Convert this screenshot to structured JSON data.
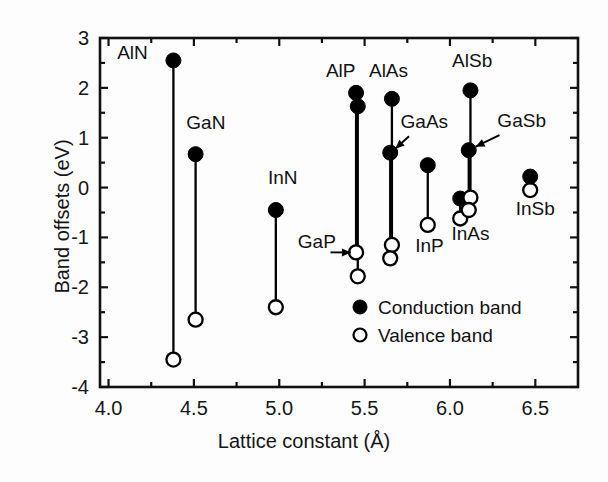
{
  "chart_data": {
    "type": "scatter",
    "title": "",
    "xlabel": "Lattice constant (Å)",
    "ylabel": "Band offsets (eV)",
    "xlim": [
      3.95,
      6.75
    ],
    "ylim": [
      -4,
      3
    ],
    "xticks": [
      4.0,
      4.5,
      5.0,
      5.5,
      6.0,
      6.5
    ],
    "xticklabels": [
      "4.0",
      "4.5",
      "5.0",
      "5.5",
      "6.0",
      "6.5"
    ],
    "xminorticks": [
      4.25,
      4.75,
      5.25,
      5.75,
      6.25,
      6.75
    ],
    "yticks": [
      -4,
      -3,
      -2,
      -1,
      0,
      1,
      2,
      3
    ],
    "yticklabels": [
      "-4",
      "-3",
      "-2",
      "-1",
      "0",
      "1",
      "2",
      "3"
    ],
    "yminorticks": [
      -3.5,
      -2.5,
      -1.5,
      -0.5,
      0.5,
      1.5,
      2.5
    ],
    "grid": false,
    "legend_position": "lower-right",
    "legend": [
      {
        "marker": "filled-circle",
        "label": "Conduction band"
      },
      {
        "marker": "open-circle",
        "label": "Valence band"
      }
    ],
    "series": [
      {
        "name": "Conduction band",
        "marker": "filled-circle",
        "color": "#000000"
      },
      {
        "name": "Valence band",
        "marker": "open-circle",
        "color": "#000000"
      }
    ],
    "points": [
      {
        "material": "AlN",
        "lattice_constant": 4.38,
        "conduction_band": 2.55,
        "valence_band": -3.45,
        "label_x": 4.23,
        "label_y": 2.58,
        "label_anchor": "end"
      },
      {
        "material": "GaN",
        "lattice_constant": 4.51,
        "conduction_band": 0.67,
        "valence_band": -2.65,
        "label_x": 4.57,
        "label_y": 1.18,
        "label_anchor": "middle"
      },
      {
        "material": "InN",
        "lattice_constant": 4.98,
        "conduction_band": -0.45,
        "valence_band": -2.4,
        "label_x": 5.02,
        "label_y": 0.08,
        "label_anchor": "middle"
      },
      {
        "material": "AlP",
        "lattice_constant": 5.45,
        "conduction_band": 1.9,
        "valence_band": -1.3,
        "label_x": 5.36,
        "label_y": 2.22,
        "label_anchor": "middle"
      },
      {
        "material": "GaP",
        "lattice_constant": 5.46,
        "conduction_band": 1.63,
        "valence_band": -1.78,
        "label_x": 5.22,
        "label_y": -1.22,
        "label_anchor": "middle"
      },
      {
        "material": "AlAs",
        "lattice_constant": 5.66,
        "conduction_band": 1.78,
        "valence_band": -1.15,
        "label_x": 5.64,
        "label_y": 2.22,
        "label_anchor": "middle"
      },
      {
        "material": "GaAs",
        "lattice_constant": 5.65,
        "conduction_band": 0.7,
        "valence_band": -1.42,
        "label_x": 5.85,
        "label_y": 1.2,
        "label_anchor": "middle"
      },
      {
        "material": "InP",
        "lattice_constant": 5.87,
        "conduction_band": 0.45,
        "valence_band": -0.75,
        "label_x": 5.88,
        "label_y": -1.3,
        "label_anchor": "middle"
      },
      {
        "material": "InAs",
        "lattice_constant": 6.06,
        "conduction_band": -0.22,
        "valence_band": -0.62,
        "label_x": 6.12,
        "label_y": -1.05,
        "label_anchor": "middle"
      },
      {
        "material": "AlSb",
        "lattice_constant": 6.12,
        "conduction_band": 1.95,
        "valence_band": -0.2,
        "label_x": 6.13,
        "label_y": 2.42,
        "label_anchor": "middle"
      },
      {
        "material": "GaSb",
        "lattice_constant": 6.11,
        "conduction_band": 0.75,
        "valence_band": -0.45,
        "label_x": 6.42,
        "label_y": 1.22,
        "label_anchor": "middle"
      },
      {
        "material": "InSb",
        "lattice_constant": 6.47,
        "conduction_band": 0.22,
        "valence_band": -0.05,
        "label_x": 6.5,
        "label_y": -0.55,
        "label_anchor": "middle"
      }
    ],
    "annotations": [
      {
        "text": "GaAs",
        "arrow_from_x": 5.76,
        "arrow_from_y": 1.03,
        "arrow_to_x": 5.68,
        "arrow_to_y": 0.78
      },
      {
        "text": "GaSb",
        "arrow_from_x": 6.29,
        "arrow_from_y": 1.05,
        "arrow_to_x": 6.15,
        "arrow_to_y": 0.82
      },
      {
        "text": "GaP",
        "arrow_from_x": 5.3,
        "arrow_from_y": -1.3,
        "arrow_to_x": 5.42,
        "arrow_to_y": -1.3
      }
    ]
  },
  "axes": {
    "xlabel": "Lattice constant (Å)",
    "ylabel": "Band offsets (eV)"
  },
  "legend": {
    "conduction_label": "Conduction band",
    "valence_label": "Valence band"
  }
}
